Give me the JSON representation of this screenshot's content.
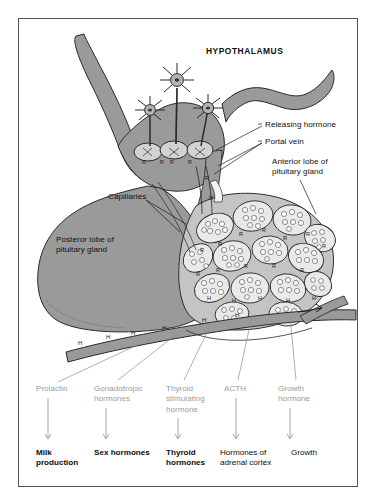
{
  "figure": {
    "title": "HYPOTHALAMUS"
  },
  "callouts": [
    {
      "name": "releasing-hormone",
      "text": "Releasing hormone",
      "x": 265,
      "y": 124
    },
    {
      "name": "portal-vein",
      "text": "Portal vein",
      "x": 265,
      "y": 141
    },
    {
      "name": "anterior-lobe",
      "text": "Anterior lobe of\npituitary gland",
      "x": 272,
      "y": 161
    },
    {
      "name": "capillaries",
      "text": "Capillaries",
      "x": 110,
      "y": 196
    },
    {
      "name": "posterior-lobe",
      "text": "Posteror lobe of\npituitary gland",
      "x": 56,
      "y": 239
    }
  ],
  "vessel_markers": {
    "releasing_hormone_symbol": "R",
    "hormone_symbol": "H",
    "hormone_tags": [
      {
        "x": 80,
        "y": 342
      },
      {
        "x": 108,
        "y": 335
      },
      {
        "x": 133,
        "y": 331
      },
      {
        "x": 164,
        "y": 326
      },
      {
        "x": 204,
        "y": 318
      },
      {
        "x": 237,
        "y": 313
      }
    ]
  },
  "hormones": [
    {
      "name": "prolactin",
      "text": "Prolactin",
      "x": 38,
      "y": 388
    },
    {
      "name": "gonadotropic-hormones",
      "text": "Gonadotropic\nhormones",
      "x": 96,
      "y": 388
    },
    {
      "name": "thyroid-stimulating",
      "text": "Thyroid\nstimulating\nhormone",
      "x": 168,
      "y": 388
    },
    {
      "name": "acth",
      "text": "ACTH",
      "x": 226,
      "y": 388
    },
    {
      "name": "growth-hormone",
      "text": "Growth\nhormone",
      "x": 280,
      "y": 388
    }
  ],
  "targets": [
    {
      "name": "milk-production",
      "text": "Milk\nproduction",
      "x": 38,
      "y": 452
    },
    {
      "name": "sex-hormones",
      "text": "Sex hormones",
      "x": 96,
      "y": 452
    },
    {
      "name": "thyroid-hormones",
      "text": "Thyroid\nhormones",
      "x": 168,
      "y": 452
    },
    {
      "name": "adrenal-cortex",
      "text": "Hormones of\nadrenal cortex",
      "x": 222,
      "y": 452
    },
    {
      "name": "growth",
      "text": "Growth",
      "x": 293,
      "y": 452
    }
  ],
  "colors": {
    "border": "#555555",
    "tissue_mid": "#9a9a9a",
    "tissue_light": "#c8c8c8",
    "tissue_dark": "#848484",
    "outline": "#2a2a2a",
    "hormone_label": "#9b9b9b",
    "target_label": "#0d0d0d",
    "page_background": "#ffffff"
  }
}
